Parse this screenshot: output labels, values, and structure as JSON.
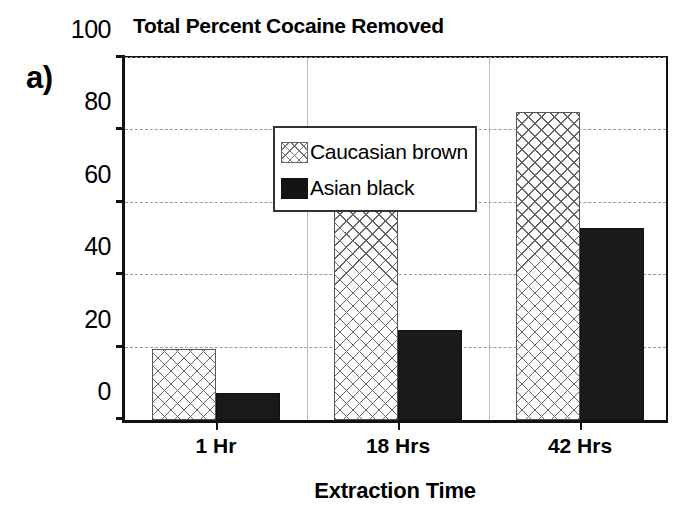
{
  "panel_label": "a)",
  "chart_data": {
    "type": "bar",
    "title": "Total Percent Cocaine Removed",
    "xlabel": "Extraction Time",
    "ylabel": "",
    "categories": [
      "1 Hr",
      "18 Hrs",
      "42 Hrs"
    ],
    "series": [
      {
        "name": "Caucasian brown",
        "values": [
          19.5,
          71,
          85
        ],
        "fill": "crosshatch",
        "color": "#ffffff"
      },
      {
        "name": "Asian black",
        "values": [
          7.5,
          25,
          53
        ],
        "fill": "solid",
        "color": "#1a1a1a"
      }
    ],
    "ylim": [
      0,
      100
    ],
    "yticks": [
      0,
      20,
      40,
      60,
      80,
      100
    ],
    "ytick_labels": [
      "0",
      "20",
      "40",
      "60",
      "80",
      "100"
    ],
    "grid": true,
    "grid_axis": "y",
    "legend_position": "upper left",
    "bar_group_mode": "grouped"
  },
  "axis": {
    "y_labels": [
      "100",
      "80",
      "60",
      "40",
      "20",
      "0"
    ],
    "x_labels": [
      "1 Hr",
      "18 Hrs",
      "42 Hrs"
    ],
    "x_title": "Extraction Time"
  },
  "legend": {
    "items": [
      {
        "label": "Caucasian brown",
        "swatch": "crosshatch-swatch-icon"
      },
      {
        "label": "Asian black",
        "swatch": "solid-black-swatch-icon"
      }
    ]
  }
}
